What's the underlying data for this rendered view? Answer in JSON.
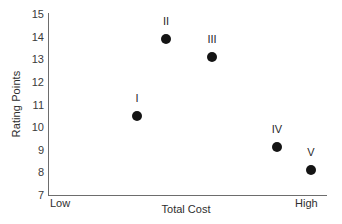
{
  "chart_data": {
    "type": "scatter",
    "title": "",
    "xlabel": "Total Cost",
    "ylabel": "Rating Points",
    "xlim": [
      "Low",
      "High"
    ],
    "ylim": [
      7,
      15
    ],
    "yticks": [
      15,
      14,
      13,
      12,
      11,
      10,
      9,
      8,
      7
    ],
    "grid": false,
    "legend": "none",
    "x_axis_endpoint_labels": {
      "left": "Low",
      "right": "High"
    },
    "points": [
      {
        "label": "I",
        "x": 0.32,
        "y": 10.5,
        "x_px": 137,
        "color": "#141414"
      },
      {
        "label": "II",
        "x": 0.42,
        "y": 13.9,
        "x_px": 166,
        "color": "#141414"
      },
      {
        "label": "III",
        "x": 0.59,
        "y": 13.1,
        "x_px": 212,
        "color": "#141414"
      },
      {
        "label": "IV",
        "x": 0.82,
        "y": 9.1,
        "x_px": 277,
        "color": "#141414"
      },
      {
        "label": "V",
        "x": 0.94,
        "y": 8.1,
        "x_px": 311,
        "color": "#141414"
      }
    ],
    "colors": {
      "marker": "#141414",
      "axis": "#6d6d6d",
      "text": "#2e2e2e",
      "background": "#ffffff"
    }
  }
}
